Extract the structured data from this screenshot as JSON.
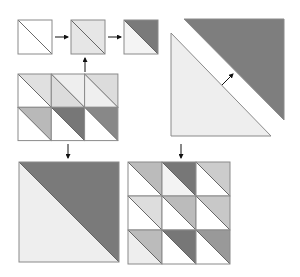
{
  "diagram": {
    "colors": {
      "white": "#ffffff",
      "very_light": "#f1f1f1",
      "light": "#e2e2e2",
      "light_mid": "#d2d2d2",
      "mid": "#b9b9b9",
      "mid_dark": "#999999",
      "dark": "#7a7a7a",
      "outline": "#8a8a8a",
      "arrow": "#111111"
    },
    "step_squares": [
      {
        "x": 18,
        "y": 20,
        "size": 34,
        "upper": "#ffffff",
        "lower": "#ffffff"
      },
      {
        "x": 71,
        "y": 20,
        "size": 34,
        "upper": "#e6e6e6",
        "lower": "#e6e6e6"
      },
      {
        "x": 124,
        "y": 20,
        "size": 34,
        "upper": "#7a7a7a",
        "lower": "#f4f4f4"
      }
    ],
    "grid_3x2": {
      "x": 18,
      "y": 74,
      "cell": 33.3,
      "cols": 3,
      "rows": 2,
      "cells": [
        {
          "upper": "#e0e0e0",
          "lower": "#ffffff"
        },
        {
          "upper": "#eeeeee",
          "lower": "#dcdcdc"
        },
        {
          "upper": "#dcdcdc",
          "lower": "#efefef"
        },
        {
          "upper": "#b9b9b9",
          "lower": "#ffffff"
        },
        {
          "upper": "#777777",
          "lower": "#ffffff"
        },
        {
          "upper": "#888888",
          "lower": "#ffffff"
        }
      ]
    },
    "big_triangles": {
      "dark": {
        "points": "184,19 284,19 284,120",
        "fill": "#7e7e7e"
      },
      "light": {
        "points": "171,33 171,136 271,136",
        "fill": "#eeeeee"
      }
    },
    "big_square": {
      "x": 19,
      "y": 162,
      "size": 100,
      "upper": "#7a7a7a",
      "lower": "#eeeeee"
    },
    "grid_3x3": {
      "x": 128,
      "y": 162,
      "cell": 34,
      "cols": 3,
      "rows": 3,
      "cells": [
        {
          "upper": "#bbbbbb",
          "lower": "#ffffff"
        },
        {
          "upper": "#777777",
          "lower": "#f3f3f3"
        },
        {
          "upper": "#cccccc",
          "lower": "#ffffff"
        },
        {
          "upper": "#dddddd",
          "lower": "#ffffff"
        },
        {
          "upper": "#bbbbbb",
          "lower": "#ffffff"
        },
        {
          "upper": "#c8c8c8",
          "lower": "#ffffff"
        },
        {
          "upper": "#bbbbbb",
          "lower": "#eeeeee"
        },
        {
          "upper": "#777777",
          "lower": "#ffffff"
        },
        {
          "upper": "#999999",
          "lower": "#ffffff"
        }
      ]
    },
    "arrows": [
      {
        "name": "arrow-step1-to-step2",
        "x1": 55,
        "y1": 37,
        "x2": 68,
        "y2": 37
      },
      {
        "name": "arrow-step2-to-step3",
        "x1": 108,
        "y1": 37,
        "x2": 121,
        "y2": 37
      },
      {
        "name": "arrow-grid-to-step2",
        "x1": 85,
        "y1": 72,
        "x2": 85,
        "y2": 58
      },
      {
        "name": "arrow-triangles-together",
        "x1": 222,
        "y1": 85,
        "x2": 233,
        "y2": 74
      },
      {
        "name": "arrow-grid-to-big-square",
        "x1": 68,
        "y1": 144,
        "x2": 68,
        "y2": 158
      },
      {
        "name": "arrow-to-3x3-grid",
        "x1": 181,
        "y1": 144,
        "x2": 181,
        "y2": 158
      }
    ]
  }
}
